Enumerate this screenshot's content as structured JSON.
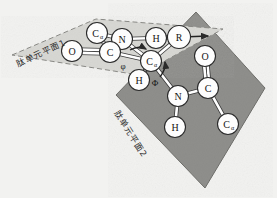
{
  "figure": {
    "background_color": "#f2f2f0"
  },
  "planes": [
    {
      "id": "plane1",
      "label": "肽单元平面1",
      "fill_color": "#d8d8d4",
      "border_style": "dashed",
      "border_color": "#8a8a86",
      "points": "12,55 96,19 223,29 139,75"
    },
    {
      "id": "plane2",
      "label": "肽单元平面2",
      "fill_color": "#8f8f8c",
      "border_style": "solid",
      "border_color": "#6e6e6a",
      "points": "196,12 265,88 205,188 116,95"
    }
  ],
  "atoms": [
    {
      "id": "a-calpha-left",
      "label": "C",
      "sub": "α",
      "cx": 97,
      "cy": 33,
      "r": 10.5
    },
    {
      "id": "a-nitrogen-top",
      "label": "N",
      "sub": "",
      "cx": 122,
      "cy": 39,
      "r": 10.5
    },
    {
      "id": "a-oxygen-left",
      "label": "O",
      "sub": "",
      "cx": 72,
      "cy": 51,
      "r": 10.5
    },
    {
      "id": "a-carbon-left",
      "label": "C",
      "sub": "",
      "cx": 110,
      "cy": 52,
      "r": 10.5
    },
    {
      "id": "a-hydrogen-top",
      "label": "H",
      "sub": "",
      "cx": 156,
      "cy": 38,
      "r": 10.5
    },
    {
      "id": "a-rgroup",
      "label": "R",
      "sub": "",
      "cx": 179,
      "cy": 37,
      "r": 11.5
    },
    {
      "id": "a-calpha-center",
      "label": "C",
      "sub": "α",
      "cx": 151,
      "cy": 61,
      "r": 10.5
    },
    {
      "id": "a-hydrogen-mid",
      "label": "H",
      "sub": "",
      "cx": 139,
      "cy": 80,
      "r": 10.5
    },
    {
      "id": "a-oxygen-right",
      "label": "O",
      "sub": "",
      "cx": 205,
      "cy": 56,
      "r": 10.5
    },
    {
      "id": "a-nitrogen-low",
      "label": "N",
      "sub": "",
      "cx": 178,
      "cy": 96,
      "r": 10.5
    },
    {
      "id": "a-carbon-right",
      "label": "C",
      "sub": "",
      "cx": 208,
      "cy": 88,
      "r": 10.5
    },
    {
      "id": "a-hydrogen-low",
      "label": "H",
      "sub": "",
      "cx": 175,
      "cy": 127,
      "r": 10.5
    },
    {
      "id": "a-calpha-right",
      "label": "C",
      "sub": "α",
      "cx": 228,
      "cy": 124,
      "r": 10.5
    }
  ],
  "bonds": [
    {
      "id": "b-calphaL-N",
      "from": "a-calpha-left",
      "to": "a-nitrogen-top",
      "order": 1
    },
    {
      "id": "b-calphaL-C",
      "from": "a-calpha-left",
      "to": "a-carbon-left",
      "order": 1
    },
    {
      "id": "b-O-C",
      "from": "a-oxygen-left",
      "to": "a-carbon-left",
      "order": 2
    },
    {
      "id": "b-C-N",
      "from": "a-carbon-left",
      "to": "a-nitrogen-top",
      "order": 1
    },
    {
      "id": "b-N-H",
      "from": "a-nitrogen-top",
      "to": "a-hydrogen-top",
      "order": 1
    },
    {
      "id": "b-H-R",
      "from": "a-hydrogen-top",
      "to": "a-rgroup",
      "order": 1
    },
    {
      "id": "b-N-calphaC",
      "from": "a-nitrogen-top",
      "to": "a-calpha-center",
      "order": 1
    },
    {
      "id": "b-C-calphaC",
      "from": "a-carbon-left",
      "to": "a-calpha-center",
      "order": 1
    },
    {
      "id": "b-R-calphaC",
      "from": "a-rgroup",
      "to": "a-calpha-center",
      "order": 1
    },
    {
      "id": "b-calphaC-H",
      "from": "a-calpha-center",
      "to": "a-hydrogen-mid",
      "order": 1
    },
    {
      "id": "b-calphaC-N2",
      "from": "a-calpha-center",
      "to": "a-nitrogen-low",
      "order": 1
    },
    {
      "id": "b-N2-C2",
      "from": "a-nitrogen-low",
      "to": "a-carbon-right",
      "order": 1
    },
    {
      "id": "b-N2-H2",
      "from": "a-nitrogen-low",
      "to": "a-hydrogen-low",
      "order": 1
    },
    {
      "id": "b-O2-C2",
      "from": "a-oxygen-right",
      "to": "a-carbon-right",
      "order": 2
    },
    {
      "id": "b-C2-calphaR",
      "from": "a-carbon-right",
      "to": "a-calpha-right",
      "order": 1
    }
  ],
  "angles": [
    {
      "id": "phi",
      "symbol": "φ",
      "x": 123,
      "y": 66
    },
    {
      "id": "psi",
      "symbol": "Φ",
      "x": 155,
      "y": 83
    }
  ],
  "arrows": [
    {
      "id": "arrow-phi-rotation",
      "path": "M 130 50 Q 139 45 146 49",
      "tip": "146,49"
    },
    {
      "id": "arrow-psi-rotation",
      "path": "M 160 77 Q 166 69 165 62",
      "tip": "165,62"
    },
    {
      "id": "arrow-axis-right",
      "path": "M 182 37 L 208 36",
      "tip": "208,36"
    }
  ],
  "colors": {
    "plane1_fill": "#d8d8d4",
    "plane2_fill": "#8f8f8c",
    "atom_fill": "#fdfdfd",
    "atom_stroke": "#2a2a2a",
    "bond_stroke": "#ffffff",
    "bond_outline": "#3a3a3a",
    "text": "#141414"
  }
}
